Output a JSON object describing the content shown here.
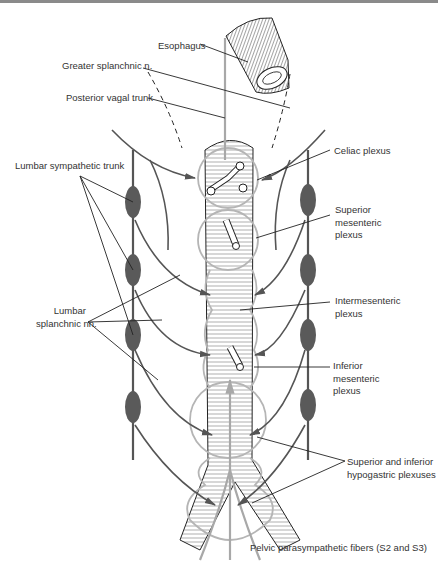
{
  "figure": {
    "type": "anatomical-diagram",
    "colors": {
      "sympathetic": "#555555",
      "ganglion": "#5a5a5a",
      "parasympathetic": "#a8a8a8",
      "plexus_outline": "#b5b5b5",
      "leader_line": "#222222",
      "label_text": "#333333"
    }
  },
  "labels": {
    "esophagus": "Esophagus",
    "greater_splanchnic": "Greater splanchnic n.",
    "posterior_vagal": "Posterior vagal trunk",
    "celiac": "Celiac plexus",
    "lumbar_sympathetic": "Lumbar sympathetic trunk",
    "superior_mesenteric": [
      "Superior",
      "mesenteric",
      "plexus"
    ],
    "lumbar_splanchnic": [
      "Lumbar",
      "splanchnic nn."
    ],
    "intermesenteric": [
      "Intermesenteric",
      "plexus"
    ],
    "inferior_mesenteric": [
      "Inferior",
      "mesenteric",
      "plexus"
    ],
    "hypogastric": [
      "Superior and inferior",
      "hypogastric plexuses"
    ],
    "pelvic": "Pelvic parasympathetic fibers (S2 and S3)"
  }
}
